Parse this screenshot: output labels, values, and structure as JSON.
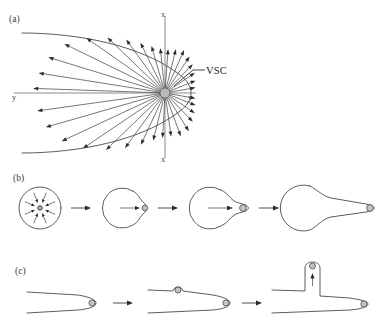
{
  "figure": {
    "caption_panels": [
      "(a)",
      "(b)",
      "(c)"
    ],
    "background_color": "#ffffff",
    "ink_color": "#231f20",
    "outline_color": "#5d5c5f",
    "node_fill_color": "#b9b8ba"
  },
  "panel_a": {
    "label": "(a)",
    "annotation": "VSC",
    "axis_labels": {
      "vertical_top": "x",
      "vertical_bottom": "x",
      "horizontal_left": "y",
      "horizontal_right": "y"
    },
    "description": "Vesicle supply center at origin with radiating displacement vectors bounded by a parabolic tube outline",
    "vsc_center": {
      "x": 165,
      "y": 93
    },
    "vector_count": 26,
    "vectors": [
      {
        "angle_deg": 178,
        "length": 132
      },
      {
        "angle_deg": 171,
        "length": 128
      },
      {
        "angle_deg": 163,
        "length": 122
      },
      {
        "angle_deg": 154,
        "length": 112
      },
      {
        "angle_deg": 145,
        "length": 96
      },
      {
        "angle_deg": 136,
        "length": 80
      },
      {
        "angle_deg": 126,
        "length": 66
      },
      {
        "angle_deg": 116,
        "length": 56
      },
      {
        "angle_deg": 106,
        "length": 49
      },
      {
        "angle_deg": 96,
        "length": 45
      },
      {
        "angle_deg": 86,
        "length": 44
      },
      {
        "angle_deg": 76,
        "length": 45
      },
      {
        "angle_deg": 66,
        "length": 47
      },
      {
        "angle_deg": 56,
        "length": 44
      },
      {
        "angle_deg": 46,
        "length": 40
      },
      {
        "angle_deg": 34,
        "length": 36
      },
      {
        "angle_deg": 22,
        "length": 33
      },
      {
        "angle_deg": 10,
        "length": 31
      },
      {
        "angle_deg": -10,
        "length": 31
      },
      {
        "angle_deg": -22,
        "length": 33
      },
      {
        "angle_deg": -34,
        "length": 36
      },
      {
        "angle_deg": -46,
        "length": 40
      },
      {
        "angle_deg": -58,
        "length": 45
      },
      {
        "angle_deg": -70,
        "length": 46
      },
      {
        "angle_deg": -82,
        "length": 44
      },
      {
        "angle_deg": -93,
        "length": 45
      },
      {
        "angle_deg": -104,
        "length": 49
      },
      {
        "angle_deg": -115,
        "length": 57
      },
      {
        "angle_deg": -126,
        "length": 68
      },
      {
        "angle_deg": -136,
        "length": 82
      },
      {
        "angle_deg": -146,
        "length": 99
      },
      {
        "angle_deg": -155,
        "length": 114
      },
      {
        "angle_deg": -164,
        "length": 124
      },
      {
        "angle_deg": -172,
        "length": 129
      }
    ]
  },
  "panel_b": {
    "label": "(b)",
    "description": "Germination sequence: isotropic vesicle delivery to a spherical cell, then polarised tube emergence and elongation",
    "stage_count": 4,
    "transition_arrows": 3,
    "stages": [
      {
        "name": "isotropic-sphere",
        "radius": 21,
        "tube_length": 0,
        "inward_arrows": 8
      },
      {
        "name": "bud-emergence",
        "radius": 20,
        "tube_length": 8
      },
      {
        "name": "short-tube",
        "radius": 21,
        "tube_length": 20
      },
      {
        "name": "elongated-tube",
        "radius": 23,
        "tube_length": 74
      }
    ]
  },
  "panel_c": {
    "label": "(c)",
    "description": "Branch formation: a new vesicle supply centre appears on the tube wall and a lateral branch grows out",
    "stage_count": 3,
    "transition_arrows": 2,
    "stages": [
      {
        "name": "straight-tube",
        "branch_height": 0
      },
      {
        "name": "branch-initiation",
        "branch_height": 7
      },
      {
        "name": "branch-elongation",
        "branch_height": 40
      }
    ]
  }
}
